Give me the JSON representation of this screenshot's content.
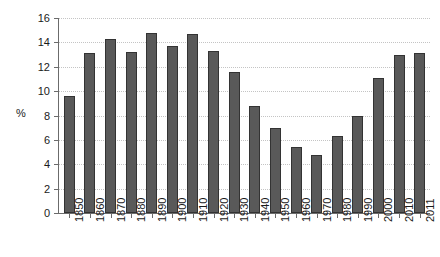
{
  "chart_data": {
    "type": "bar",
    "title": "",
    "xlabel": "",
    "ylabel": "%",
    "ylim": [
      0,
      16
    ],
    "ytick_step": 2,
    "yticks": [
      0,
      2,
      4,
      6,
      8,
      10,
      12,
      14,
      16
    ],
    "grid": true,
    "legend": false,
    "categories": [
      "1850",
      "1860",
      "1870",
      "1880",
      "1890",
      "1900",
      "1910",
      "1920",
      "1930",
      "1940",
      "1950",
      "1960",
      "1970",
      "1980",
      "1990",
      "2000",
      "2010",
      "2011"
    ],
    "values": [
      9.6,
      13.1,
      14.3,
      13.2,
      14.8,
      13.7,
      14.7,
      13.3,
      11.6,
      8.8,
      7.0,
      5.4,
      4.8,
      6.3,
      8.0,
      11.1,
      13.0,
      13.1
    ],
    "colors": {
      "bar_fill": "#595959",
      "bar_edge": "#333333",
      "axis": "#6b6b6b",
      "grid": "#c4c4c4",
      "text": "#1a1a1a",
      "background": "#ffffff"
    }
  }
}
